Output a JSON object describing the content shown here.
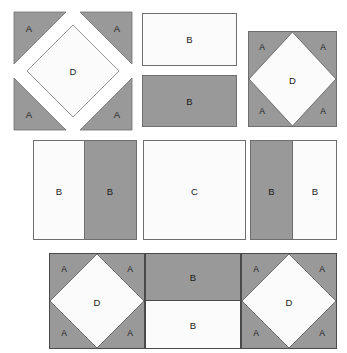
{
  "diagram": {
    "width": 347,
    "height": 353,
    "colors": {
      "background": "#ffffff",
      "fabric_light": "#fbfbfb",
      "fabric_dark": "#999999",
      "outline": "#6e6e6e",
      "outline_dark": "#4a4a4a",
      "label_text": "#1a1a1a"
    },
    "piece_labels": {
      "corner_triangle": "A",
      "rectangle": "B",
      "center_square": "C",
      "diamond": "D"
    },
    "rows": [
      {
        "name": "row-top",
        "units": [
          {
            "name": "exploded-square-in-square",
            "kind": "exploded",
            "labels": {
              "corner_top_left": "A",
              "corner_top_right": "A",
              "corner_bottom_left": "A",
              "corner_bottom_right": "A",
              "center": "D"
            }
          },
          {
            "name": "rectangle-light",
            "kind": "rectangle",
            "fill": "light",
            "label": "B"
          },
          {
            "name": "rectangle-dark",
            "kind": "rectangle",
            "fill": "dark",
            "label": "B"
          },
          {
            "name": "assembled-square-in-square",
            "kind": "assembled",
            "labels": {
              "corner_top_left": "A",
              "corner_top_right": "A",
              "corner_bottom_left": "A",
              "corner_bottom_right": "A",
              "center": "D"
            }
          }
        ]
      },
      {
        "name": "row-middle",
        "units": [
          {
            "name": "split-square-light-dark",
            "kind": "split-vertical",
            "left": {
              "fill": "light",
              "label": "B"
            },
            "right": {
              "fill": "dark",
              "label": "B"
            }
          },
          {
            "name": "plain-square-center",
            "kind": "square",
            "fill": "light",
            "label": "C"
          },
          {
            "name": "split-square-dark-light",
            "kind": "split-vertical",
            "left": {
              "fill": "dark",
              "label": "B"
            },
            "right": {
              "fill": "light",
              "label": "B"
            }
          }
        ]
      },
      {
        "name": "row-bottom",
        "units": [
          {
            "name": "assembled-square-in-square-left",
            "kind": "assembled",
            "labels": {
              "corner_top_left": "A",
              "corner_top_right": "A",
              "corner_bottom_left": "A",
              "corner_bottom_right": "A",
              "center": "D"
            }
          },
          {
            "name": "split-square-dark-top-light-bottom",
            "kind": "split-horizontal",
            "top": {
              "fill": "dark",
              "label": "B"
            },
            "bottom": {
              "fill": "light",
              "label": "B"
            }
          },
          {
            "name": "assembled-square-in-square-right",
            "kind": "assembled",
            "labels": {
              "corner_top_left": "A",
              "corner_top_right": "A",
              "corner_bottom_left": "A",
              "corner_bottom_right": "A",
              "center": "D"
            }
          }
        ]
      }
    ]
  }
}
